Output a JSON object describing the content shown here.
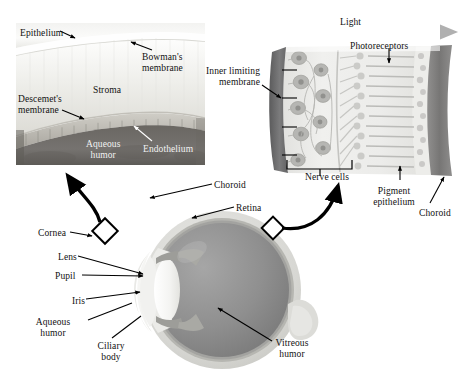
{
  "figure": {
    "type": "anatomical-diagram"
  },
  "palette": {
    "background": "#ffffff",
    "text": "#111111",
    "text_light": "#f2f2f2",
    "stroke": "#000000",
    "cornea_stroma": "#ededea",
    "cornea_epithelium": "#f7f7f5",
    "cornea_endothelium": "#b9b6ae",
    "aqueous_dark": "#6e6b66",
    "retina_body": "#e8e8e6",
    "retina_inner_membrane": "#6f6f70",
    "retina_pigment": "#8d8c8b",
    "retina_choroid": "#7a7978",
    "sclera": "#d9d9d6",
    "choroid_ring": "#b0b0ab",
    "vitreous": "#8e8e8e",
    "lens": "#f4f4f2",
    "iris": "#9b9b97",
    "arrow_light": "#8b8b8b"
  },
  "cornea_inset": {
    "name": "cornea-cross-section",
    "labels": [
      {
        "id": "epithelium",
        "text": "Epithelium",
        "x": 20,
        "y": 28,
        "on_dark": false
      },
      {
        "id": "bowmans-membrane",
        "text": "Bowman's\nmembrane",
        "x": 142,
        "y": 52,
        "on_dark": false
      },
      {
        "id": "stroma",
        "text": "Stroma",
        "x": 93,
        "y": 85,
        "on_dark": false
      },
      {
        "id": "descemets-membrane",
        "text": "Descemet's\nmembrane",
        "x": 18,
        "y": 94,
        "on_dark": false
      },
      {
        "id": "aqueous-humor",
        "text": "Aqueous\nhumor",
        "x": 86,
        "y": 139,
        "on_dark": true
      },
      {
        "id": "endothelium",
        "text": "Endothelium",
        "x": 143,
        "y": 144,
        "on_dark": true
      }
    ]
  },
  "retina_inset": {
    "name": "retina-cross-section",
    "labels": [
      {
        "id": "light",
        "text": "Light",
        "x": 340,
        "y": 17,
        "on_dark": false
      },
      {
        "id": "photoreceptors",
        "text": "Photoreceptors",
        "x": 350,
        "y": 41,
        "on_dark": false
      },
      {
        "id": "inner-limiting-membrane",
        "text": "Inner limiting\nmembrane",
        "x": 228,
        "y": 66,
        "on_dark": false
      },
      {
        "id": "nerve-cells",
        "text": "Nerve cells",
        "x": 305,
        "y": 172,
        "on_dark": false
      },
      {
        "id": "pigment-epithelium",
        "text": "Pigment\nepithelium",
        "x": 379,
        "y": 186,
        "on_dark": false
      },
      {
        "id": "choroid-retina",
        "text": "Choroid",
        "x": 419,
        "y": 208,
        "on_dark": false
      }
    ]
  },
  "eye_diagram": {
    "name": "whole-eye-cross-section",
    "labels": [
      {
        "id": "choroid",
        "text": "Choroid",
        "x": 214,
        "y": 180,
        "on_dark": false
      },
      {
        "id": "retina",
        "text": "Retina",
        "x": 236,
        "y": 203,
        "on_dark": false
      },
      {
        "id": "cornea",
        "text": "Cornea",
        "x": 38,
        "y": 228,
        "on_dark": false
      },
      {
        "id": "lens",
        "text": "Lens",
        "x": 58,
        "y": 252,
        "on_dark": false
      },
      {
        "id": "pupil",
        "text": "Pupil",
        "x": 55,
        "y": 271,
        "on_dark": false
      },
      {
        "id": "iris",
        "text": "Iris",
        "x": 72,
        "y": 296,
        "on_dark": false
      },
      {
        "id": "aqueous-humor-eye",
        "text": "Aqueous\nhumor",
        "x": 28,
        "y": 317,
        "on_dark": false
      },
      {
        "id": "ciliary-body",
        "text": "Ciliary\nbody",
        "x": 95,
        "y": 341,
        "on_dark": false
      },
      {
        "id": "vitreous-humor",
        "text": "Vitreous\nhumor",
        "x": 274,
        "y": 338,
        "on_dark": false
      }
    ]
  }
}
